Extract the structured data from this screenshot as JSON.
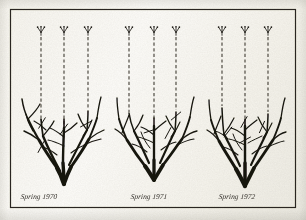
{
  "figure": {
    "medium": "pen-and-ink line drawing",
    "background_color": "#fbfaf6",
    "ink_color": "#17150f",
    "frame": {
      "present": true,
      "color": "#2b2822",
      "x": 10,
      "y": 9,
      "width": 286,
      "height": 199,
      "stroke_width": 1.2
    }
  },
  "panels": [
    {
      "id": "panel-1970",
      "caption": "Spring 1970",
      "caption_x": 38,
      "caption_y": 193,
      "center_x": 66,
      "base_x": 66,
      "base_y": 182,
      "dashed_guides": [
        {
          "x": 41,
          "y_top": 36,
          "y_bottom": 118
        },
        {
          "x": 64,
          "y_top": 36,
          "y_bottom": 126
        },
        {
          "x": 88,
          "y_top": 36,
          "y_bottom": 108
        }
      ],
      "bud_glyphs": [
        {
          "x": 41,
          "y": 31
        },
        {
          "x": 64,
          "y": 31
        },
        {
          "x": 88,
          "y": 31
        }
      ],
      "cut_marks": [
        {
          "x": 42,
          "y": 123,
          "angle": 58
        },
        {
          "x": 41,
          "y": 147,
          "angle": 62
        },
        {
          "x": 64,
          "y": 129,
          "angle": 54
        },
        {
          "x": 86,
          "y": 124,
          "angle": 28
        }
      ]
    },
    {
      "id": "panel-1971",
      "caption": "Spring 1971",
      "caption_x": 148,
      "caption_y": 193,
      "center_x": 159,
      "base_x": 159,
      "base_y": 178,
      "dashed_guides": [
        {
          "x": 129,
          "y_top": 36,
          "y_bottom": 112
        },
        {
          "x": 154,
          "y_top": 36,
          "y_bottom": 120
        },
        {
          "x": 176,
          "y_top": 36,
          "y_bottom": 110
        }
      ],
      "bud_glyphs": [
        {
          "x": 129,
          "y": 31
        },
        {
          "x": 154,
          "y": 31
        },
        {
          "x": 176,
          "y": 31
        }
      ],
      "cut_marks": [
        {
          "x": 150,
          "y": 131,
          "angle": 18
        },
        {
          "x": 168,
          "y": 133,
          "angle": 62
        },
        {
          "x": 176,
          "y": 116,
          "angle": 40
        }
      ]
    },
    {
      "id": "panel-1972",
      "caption": "Spring 1972",
      "caption_x": 236,
      "caption_y": 193,
      "center_x": 245,
      "base_x": 245,
      "base_y": 184,
      "dashed_guides": [
        {
          "x": 222,
          "y_top": 36,
          "y_bottom": 106
        },
        {
          "x": 245,
          "y_top": 36,
          "y_bottom": 118
        },
        {
          "x": 268,
          "y_top": 36,
          "y_bottom": 112
        }
      ],
      "bud_glyphs": [
        {
          "x": 222,
          "y": 31
        },
        {
          "x": 245,
          "y": 31
        },
        {
          "x": 268,
          "y": 31
        }
      ],
      "cut_marks": [
        {
          "x": 228,
          "y": 132,
          "angle": 52
        },
        {
          "x": 244,
          "y": 122,
          "angle": 60
        },
        {
          "x": 245,
          "y": 140,
          "angle": 28
        },
        {
          "x": 262,
          "y": 127,
          "angle": 66
        }
      ]
    }
  ],
  "legend": {
    "dashed_line_meaning": "projected new shoot growth",
    "bud_glyph_meaning": "new bud / shoot tip",
    "cut_mark_meaning": "pruning cut"
  }
}
